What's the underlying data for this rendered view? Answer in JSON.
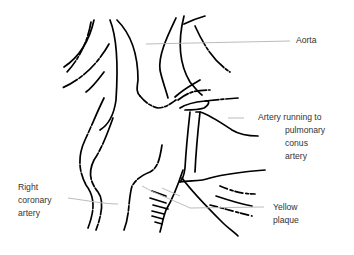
{
  "diagram": {
    "type": "anatomical line drawing",
    "labels": [
      {
        "id": "aorta",
        "text": "Aorta"
      },
      {
        "id": "conus",
        "lines": [
          "Artery running to",
          "pulmonary",
          "conus",
          "artery"
        ]
      },
      {
        "id": "rca",
        "lines": [
          "Right",
          "coronary",
          "artery"
        ]
      },
      {
        "id": "plaque",
        "lines": [
          "Yellow",
          "plaque"
        ]
      }
    ],
    "colors": {
      "outline": "#000000",
      "leader_line": "#b3b3b3",
      "label_text": "#333333",
      "background": "#ffffff"
    }
  }
}
